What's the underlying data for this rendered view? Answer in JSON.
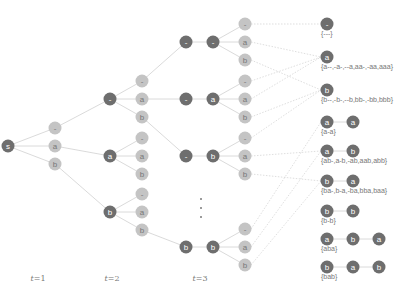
{
  "time_labels": [
    {
      "var": "t",
      "text": "=1",
      "x": 38
    },
    {
      "var": "t",
      "text": "=2",
      "x": 112
    },
    {
      "var": "t",
      "text": "=3",
      "x": 200
    }
  ],
  "colors": {
    "dark_node": "#6e6e6e",
    "light_node": "#c4c4c4",
    "edge": "#d0d0d0",
    "text": "#777777"
  },
  "tree": {
    "root": {
      "label": "s",
      "x": 8,
      "y": 146
    },
    "t1_children": [
      {
        "label": "-",
        "x": 55,
        "y": 128
      },
      {
        "label": "a",
        "x": 55,
        "y": 146
      },
      {
        "label": "b",
        "x": 55,
        "y": 164
      }
    ],
    "t2_parents": [
      {
        "label": "-",
        "x": 110,
        "y": 99,
        "from": 0
      },
      {
        "label": "a",
        "x": 110,
        "y": 156,
        "from": 1
      },
      {
        "label": "b",
        "x": 110,
        "y": 212,
        "from": 2
      }
    ],
    "t2_children": [
      {
        "label": "-",
        "x": 142,
        "y": 81,
        "parent": 0
      },
      {
        "label": "a",
        "x": 142,
        "y": 99,
        "parent": 0
      },
      {
        "label": "b",
        "x": 142,
        "y": 117,
        "parent": 0
      },
      {
        "label": "-",
        "x": 142,
        "y": 138,
        "parent": 1
      },
      {
        "label": "a",
        "x": 142,
        "y": 156,
        "parent": 1
      },
      {
        "label": "b",
        "x": 142,
        "y": 174,
        "parent": 1
      },
      {
        "label": "-",
        "x": 142,
        "y": 194,
        "parent": 2
      },
      {
        "label": "a",
        "x": 142,
        "y": 212,
        "parent": 2
      },
      {
        "label": "b",
        "x": 142,
        "y": 230,
        "parent": 2
      }
    ],
    "t3_rows": [
      {
        "first": "-",
        "second": "-",
        "y": 42,
        "from_t2_child": 0
      },
      {
        "first": "-",
        "second": "a",
        "y": 99,
        "from_t2_child": 1
      },
      {
        "first": "-",
        "second": "b",
        "y": 156,
        "from_t2_child": 2
      },
      {
        "first": "b",
        "second": "b",
        "y": 247,
        "from_t2_child": 8
      }
    ],
    "t3_children_labels": [
      "-",
      "a",
      "b"
    ],
    "ellipsis": {
      "x": 200,
      "y": [
        198,
        207,
        216
      ]
    }
  },
  "results": [
    {
      "nodes": [
        "-"
      ],
      "set": "{---}",
      "y": 24
    },
    {
      "nodes": [
        "a"
      ],
      "set": "{a--,-a-,--a,aa-,-aa,aaa}",
      "y": 57
    },
    {
      "nodes": [
        "b"
      ],
      "set": "{b--,-b-,--b,bb-,-bb,bbb}",
      "y": 90
    },
    {
      "nodes": [
        "a",
        "a"
      ],
      "set": "{a-a}",
      "y": 122
    },
    {
      "nodes": [
        "a",
        "b"
      ],
      "set": "{ab-,a-b,-ab,aab,abb}",
      "y": 151
    },
    {
      "nodes": [
        "b",
        "a"
      ],
      "set": "{ba-,b-a,-ba,bba,baa}",
      "y": 181
    },
    {
      "nodes": [
        "b",
        "b"
      ],
      "set": "{b-b}",
      "y": 211
    },
    {
      "nodes": [
        "a",
        "b",
        "a"
      ],
      "set": "{aba}",
      "y": 239
    },
    {
      "nodes": [
        "b",
        "a",
        "b"
      ],
      "set": "{bab}",
      "y": 267
    }
  ],
  "t3_links": [
    [
      0,
      0
    ],
    [
      1,
      1
    ],
    [
      2,
      2
    ],
    [
      3,
      1
    ],
    [
      4,
      1
    ],
    [
      5,
      2
    ],
    [
      6,
      2
    ],
    [
      7,
      4
    ],
    [
      8,
      5
    ],
    [
      9,
      3
    ],
    [
      10,
      4
    ],
    [
      11,
      5
    ]
  ]
}
